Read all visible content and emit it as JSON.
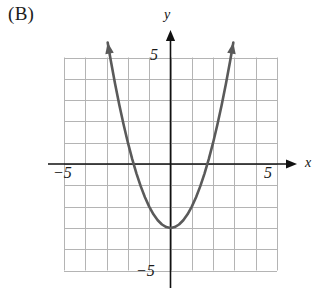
{
  "figure": {
    "part_label": "(B)",
    "axis_labels": {
      "x_name": "x",
      "y_name": "y"
    },
    "tick_labels": {
      "y_positive": "5",
      "y_negative": "−5",
      "x_negative": "−5",
      "x_positive": "5"
    },
    "colors": {
      "curve": "#5a5a5a",
      "axis": "#111111",
      "grid": "#b4b4b4",
      "background": "#ffffff",
      "text": "#1a1a1a"
    }
  },
  "chart_data": {
    "type": "line",
    "title": "",
    "subtitle": "",
    "xlabel": "x",
    "ylabel": "y",
    "xlim": [
      -5,
      5
    ],
    "ylim": [
      -5,
      5
    ],
    "xticks": [
      -5,
      5
    ],
    "yticks": [
      -5,
      5
    ],
    "xtick_labels": [
      "−5",
      "5"
    ],
    "ytick_labels": [
      "−5",
      "5"
    ],
    "grid": true,
    "grid_step": 1,
    "legend": "none",
    "annotations": [
      "(B)"
    ],
    "series": [
      {
        "name": "parabola",
        "equation": "y = x^2 - 3",
        "vertex": [
          0,
          -3
        ],
        "opens": "up",
        "roots": [
          -1.732,
          1.732
        ],
        "y_intercept": -3,
        "arrow_ends": "both",
        "x": [
          -2.95,
          -2.8,
          -2.6,
          -2.4,
          -2.2,
          -2.0,
          -1.8,
          -1.6,
          -1.4,
          -1.2,
          -1.0,
          -0.8,
          -0.6,
          -0.4,
          -0.2,
          0.0,
          0.2,
          0.4,
          0.6,
          0.8,
          1.0,
          1.2,
          1.4,
          1.6,
          1.8,
          2.0,
          2.2,
          2.4,
          2.6,
          2.8,
          2.95
        ],
        "y": [
          5.7,
          4.84,
          3.76,
          2.76,
          1.84,
          1.0,
          0.24,
          -0.44,
          -1.04,
          -1.56,
          -2.0,
          -2.36,
          -2.64,
          -2.84,
          -2.96,
          -3.0,
          -2.96,
          -2.84,
          -2.64,
          -2.36,
          -2.0,
          -1.56,
          -1.04,
          -0.44,
          0.24,
          1.0,
          1.84,
          2.76,
          3.76,
          4.84,
          5.7
        ]
      }
    ]
  }
}
